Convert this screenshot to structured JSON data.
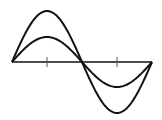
{
  "diagram": {
    "title": "",
    "stroke_color": "#111111",
    "axis": {
      "x_start": 12,
      "x_end": 152,
      "y": 62,
      "ticks_x": [
        47,
        117
      ]
    },
    "curves": [
      {
        "name": "large-amplitude-sine",
        "amplitude": 51,
        "period_px": 140
      },
      {
        "name": "small-amplitude-sine",
        "amplitude": 25,
        "period_px": 140
      }
    ]
  }
}
